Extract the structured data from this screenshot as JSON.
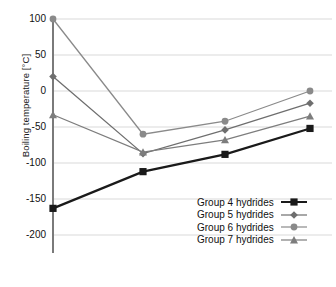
{
  "chart_data": {
    "type": "line",
    "title": "",
    "xlabel": "",
    "ylabel": "Boiling temperature [°C]",
    "categories": [
      "2",
      "3",
      "4",
      "5"
    ],
    "x": [
      1,
      2,
      3,
      4
    ],
    "ylim": [
      -200,
      100
    ],
    "yticks": [
      100,
      50,
      0,
      -50,
      -100,
      -150,
      -200
    ],
    "ytick_labels": [
      "100",
      "50",
      "0",
      "-50",
      "-100",
      "-150",
      "-200"
    ],
    "grid": true,
    "legend_position": "lower right",
    "series": [
      {
        "name": "Group 4 hydrides",
        "values": [
          -163,
          -112,
          -88,
          -52
        ],
        "color": "#1a1a1a",
        "marker": "square"
      },
      {
        "name": "Group 5 hydrides",
        "values": [
          20,
          -87,
          -54,
          -17
        ],
        "color": "#6e6e6e",
        "marker": "diamond"
      },
      {
        "name": "Group 6 hydrides",
        "values": [
          100,
          -60,
          -42,
          0
        ],
        "color": "#8a8a8a",
        "marker": "circle"
      },
      {
        "name": "Group 7 hydrides",
        "values": [
          -33,
          -85,
          -68,
          -35
        ],
        "color": "#7d7d7d",
        "marker": "triangle"
      }
    ]
  },
  "axis": {
    "y_label": "Boiling temperature [°C]",
    "tick_100": "100",
    "tick_50": "50",
    "tick_0": "0",
    "tick_m50": "-50",
    "tick_m100": "-100",
    "tick_m150": "-150",
    "tick_m200": "-200"
  },
  "legend": {
    "items": [
      {
        "label": "Group 4 hydrides"
      },
      {
        "label": "Group 5 hydrides"
      },
      {
        "label": "Group 6 hydrides"
      },
      {
        "label": "Group 7 hydrides"
      }
    ]
  },
  "colors": {
    "group4": "#1a1a1a",
    "group5": "#6e6e6e",
    "group6": "#8a8a8a",
    "group7": "#7d7d7d",
    "grid": "#d9d9d9",
    "axis": "#7a7a7a",
    "text": "#111111"
  }
}
